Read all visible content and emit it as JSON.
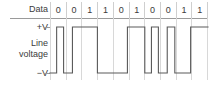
{
  "figure": {
    "row_header_label": "Data",
    "voltage_high_label": "+V",
    "voltage_low_label": "−V",
    "signal_label_line1": "Line",
    "signal_label_line2": "voltage",
    "colors": {
      "wave_stroke": "#5a5a5a",
      "gridline": "#d8d8d8",
      "rule": "#9a9a9a",
      "text": "#3b3b3b",
      "background": "#ffffff"
    }
  },
  "chart_data": {
    "type": "line",
    "title": "Line voltage",
    "xlabel": "",
    "ylabel": "Line voltage",
    "categories": [
      "0",
      "0",
      "1",
      "1",
      "0",
      "1",
      "0",
      "0",
      "1",
      "1"
    ],
    "bits": [
      0,
      0,
      1,
      1,
      0,
      1,
      0,
      0,
      1,
      1
    ],
    "ytick_labels": [
      "+V",
      "−V"
    ],
    "ylim": [
      -1,
      1
    ],
    "grid": true,
    "legend": "none",
    "encoding_note": "bipolar return-to-zero style line code; level alternates between +V and −V across bit cells",
    "series": [
      {
        "name": "Line voltage",
        "step_levels": [
          -1,
          1,
          -1,
          1,
          1,
          1,
          -1,
          -1,
          -1,
          1,
          1,
          1,
          -1,
          1,
          -1,
          1,
          -1,
          1,
          1
        ],
        "points": [
          {
            "x": 0.0,
            "y": -1
          },
          {
            "x": 0.42,
            "y": -1
          },
          {
            "x": 0.42,
            "y": 1
          },
          {
            "x": 0.86,
            "y": 1
          },
          {
            "x": 0.86,
            "y": -1
          },
          {
            "x": 1.42,
            "y": -1
          },
          {
            "x": 1.42,
            "y": 1
          },
          {
            "x": 3.0,
            "y": 1
          },
          {
            "x": 3.0,
            "y": -1
          },
          {
            "x": 4.9,
            "y": -1
          },
          {
            "x": 4.9,
            "y": 1
          },
          {
            "x": 6.0,
            "y": 1
          },
          {
            "x": 6.0,
            "y": -1
          },
          {
            "x": 6.42,
            "y": -1
          },
          {
            "x": 6.42,
            "y": 1
          },
          {
            "x": 6.86,
            "y": 1
          },
          {
            "x": 6.86,
            "y": -1
          },
          {
            "x": 7.42,
            "y": -1
          },
          {
            "x": 7.42,
            "y": 1
          },
          {
            "x": 7.9,
            "y": 1
          },
          {
            "x": 7.9,
            "y": -1
          },
          {
            "x": 8.9,
            "y": -1
          },
          {
            "x": 8.9,
            "y": 1
          },
          {
            "x": 10.0,
            "y": 1
          }
        ]
      }
    ]
  }
}
